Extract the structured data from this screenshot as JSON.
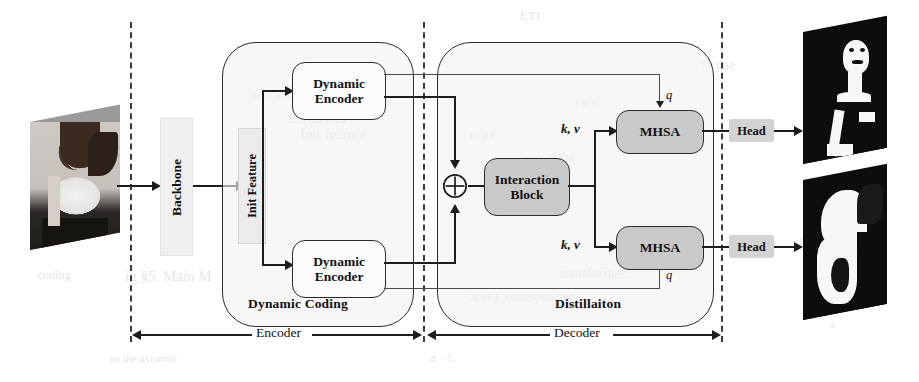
{
  "figure": {
    "type": "architecture-diagram"
  },
  "colors": {
    "stroke": "#1d1d1d",
    "dash": "#3a3a3a",
    "node_fill": "#fbfbfb",
    "node_gray": "#c9c9c9",
    "node_light": "#ececec",
    "head_fill": "#d3d3d3",
    "container_fill": "#f2f2f2",
    "mask_fg": "#ffffff",
    "mask_bg": "#0d0d0d"
  },
  "input": {
    "name": "input-image",
    "caption": ""
  },
  "backbone": {
    "label": "Backbone"
  },
  "init_feature": {
    "label": "Init Feature"
  },
  "encoders": [
    {
      "label_line1": "Dynamic",
      "label_line2": "Encoder",
      "position": "top"
    },
    {
      "label_line1": "Dynamic",
      "label_line2": "Encoder",
      "position": "bottom"
    }
  ],
  "interaction": {
    "label_line1": "Interaction",
    "label_line2": "Block"
  },
  "attention": [
    {
      "label": "MHSA",
      "position": "top"
    },
    {
      "label": "MHSA",
      "position": "bottom"
    }
  ],
  "heads": [
    {
      "label": "Head",
      "position": "top"
    },
    {
      "label": "Head",
      "position": "bottom"
    }
  ],
  "containers": [
    {
      "label": "Dynamic Coding"
    },
    {
      "label": "Distillaiton"
    }
  ],
  "stage_spans": [
    {
      "label": "Encoder"
    },
    {
      "label": "Decoder"
    }
  ],
  "signal_labels": {
    "kv_top": "k, v",
    "kv_bottom": "k, v",
    "q_top": "q",
    "q_bottom": "q"
  },
  "operators": {
    "sum": "⊕"
  },
  "outputs": [
    {
      "name": "output-mask-top",
      "caption": ""
    },
    {
      "name": "output-mask-bottom",
      "caption": ""
    }
  ],
  "bleed_text": [
    {
      "text": "ETI",
      "x": 520,
      "y": 8,
      "size": 13
    },
    {
      "text": "he is a binary of the binary",
      "x": 250,
      "y": 88,
      "size": 12
    },
    {
      "text": "and tan mea",
      "x": 288,
      "y": 112,
      "size": 12
    },
    {
      "text": "Init feature",
      "x": 300,
      "y": 126,
      "size": 15
    },
    {
      "text": "to a f.",
      "x": 470,
      "y": 128,
      "size": 12
    },
    {
      "text": "bank of the",
      "x": 520,
      "y": 150,
      "size": 12
    },
    {
      "text": "i of f",
      "x": 575,
      "y": 96,
      "size": 11
    },
    {
      "text": "Tn thie",
      "x": 700,
      "y": 58,
      "size": 12
    },
    {
      "text": "of the",
      "x": 800,
      "y": 232,
      "size": 11
    },
    {
      "text": "the dynamic",
      "x": 40,
      "y": 222,
      "size": 12
    },
    {
      "text": "coding",
      "x": 38,
      "y": 268,
      "size": 12
    },
    {
      "text": "ig §5. Main M",
      "x": 125,
      "y": 268,
      "size": 15
    },
    {
      "text": "transformer.",
      "x": 560,
      "y": 266,
      "size": 14
    },
    {
      "text": "at of f₁ corresponding",
      "x": 470,
      "y": 290,
      "size": 12
    },
    {
      "text": "en the dynamic",
      "x": 110,
      "y": 352,
      "size": 11
    },
    {
      "text": "4. · 5",
      "x": 430,
      "y": 352,
      "size": 11
    },
    {
      "text": "a",
      "x": 830,
      "y": 318,
      "size": 11
    }
  ]
}
